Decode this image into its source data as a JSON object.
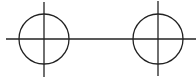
{
  "diagram": {
    "stroke_color": "#222222",
    "background": "#ffffff",
    "baseline": {
      "x1": 6,
      "y1": 39,
      "x2": 196,
      "y2": 39
    },
    "nodes": [
      {
        "name": "left-crosshair-circle",
        "cx": 44,
        "cy": 39,
        "r": 25,
        "vline_y1": 2,
        "vline_y2": 77
      },
      {
        "name": "right-crosshair-circle",
        "cx": 158,
        "cy": 39,
        "r": 25,
        "vline_y1": 1,
        "vline_y2": 76
      }
    ]
  }
}
